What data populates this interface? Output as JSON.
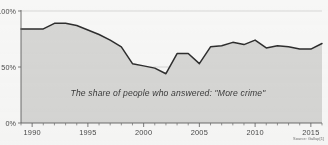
{
  "chart_data": {
    "type": "area",
    "title": "",
    "subtitle": "",
    "annotation": "The share of people who answered: \"More crime\"",
    "source": "Source: Gallup[1]",
    "xlabel": "",
    "ylabel": "",
    "xlim": [
      1989,
      2016
    ],
    "ylim": [
      0,
      100
    ],
    "grid": true,
    "legend_position": "none",
    "y_ticks": [
      0,
      50,
      100
    ],
    "y_tick_labels": [
      "0%",
      "50%",
      "100%"
    ],
    "x_ticks": [
      1990,
      1995,
      2000,
      2005,
      2010,
      2015
    ],
    "x_tick_labels": [
      "1990",
      "1995",
      "2000",
      "2005",
      "2010",
      "2015"
    ],
    "x_minor_tick_interval": 1,
    "series": [
      {
        "name": "More crime",
        "line_color": "#2e2e2e",
        "fill_color": "#d6d6d4",
        "x": [
          1989,
          1990,
          1991,
          1992,
          1993,
          1994,
          1995,
          1996,
          1997,
          1998,
          1999,
          2000,
          2001,
          2002,
          2003,
          2004,
          2005,
          2006,
          2007,
          2008,
          2009,
          2010,
          2011,
          2012,
          2013,
          2014,
          2015,
          2016
        ],
        "values": [
          84,
          84,
          84,
          89,
          89,
          87,
          83,
          79,
          74,
          68,
          53,
          51,
          49,
          44,
          62,
          62,
          53,
          68,
          69,
          72,
          70,
          74,
          67,
          69,
          68,
          66,
          66,
          71
        ]
      }
    ]
  }
}
